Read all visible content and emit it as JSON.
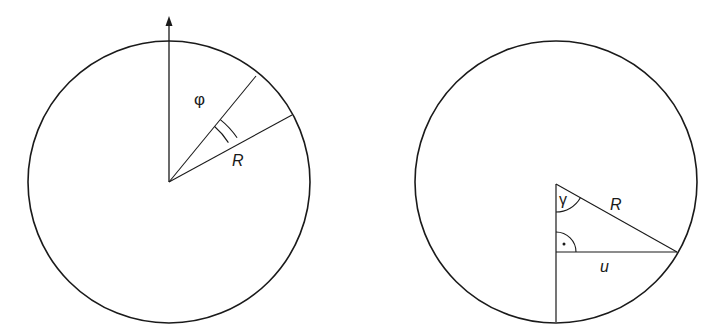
{
  "figure": {
    "background": "#ffffff",
    "stroke_color": "#1a1a1a",
    "left_panel": {
      "description": "circle with vertical axis arrow and sector of angle phi with width element along radius R",
      "circle": {
        "cx": 169,
        "cy": 182,
        "r": 141
      },
      "center": {
        "x": 169,
        "y": 182
      },
      "axis_arrow": {
        "from": [
          169,
          182
        ],
        "to": [
          169,
          18
        ]
      },
      "ray_upper": {
        "to": [
          256,
          77
        ]
      },
      "ray_lower": {
        "to": [
          292,
          115
        ]
      },
      "labels": {
        "phi": "φ",
        "radius": "R"
      }
    },
    "right_panel": {
      "description": "circle with vertical chord from center to bottom, right triangle with hypotenuse R, angle gamma at center, horizontal leg u",
      "circle": {
        "cx": 556,
        "cy": 182,
        "r": 141
      },
      "apex": {
        "x": 556,
        "y": 184
      },
      "foot": {
        "x": 556,
        "y": 252
      },
      "rim_point": {
        "x": 677,
        "y": 252
      },
      "bottom": {
        "x": 556,
        "y": 322
      },
      "labels": {
        "gamma": "γ",
        "radius": "R",
        "leg": "u",
        "right_angle_dot": "·"
      }
    }
  }
}
